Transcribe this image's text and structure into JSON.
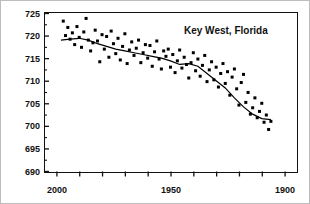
{
  "chart_data": {
    "type": "scatter",
    "title": "Key West, Florida",
    "xlabel": "",
    "ylabel": "Distance above Reference Level (cm)",
    "xlim": [
      2005,
      1895
    ],
    "ylim": [
      690,
      725
    ],
    "x_reversed": true,
    "grid": false,
    "legend": null,
    "y_ticks": [
      690,
      695,
      700,
      705,
      710,
      715,
      720,
      725
    ],
    "y_tick_labels": [
      "690",
      "695",
      "700",
      "705",
      "710",
      "715",
      "720",
      "725"
    ],
    "y_minor_step": 2.5,
    "x_ticks": [
      2000,
      1990,
      1980,
      1970,
      1960,
      1950,
      1940,
      1930,
      1920,
      1910,
      1900
    ],
    "x_tick_labels_shown": [
      "2000",
      "1950",
      "1900"
    ],
    "x_labeled_ticks": [
      2000,
      1950,
      1900
    ],
    "marker": "filled-square",
    "marker_size_px": 3,
    "series": [
      {
        "name": "Annual sea level measurements",
        "type": "scatter",
        "x": [
          1997,
          1996,
          1995,
          1994,
          1993,
          1992,
          1991,
          1990,
          1989,
          1988,
          1987,
          1986,
          1985,
          1984,
          1983,
          1982,
          1981,
          1980,
          1979,
          1978,
          1977,
          1976,
          1975,
          1974,
          1973,
          1972,
          1971,
          1970,
          1969,
          1968,
          1967,
          1966,
          1965,
          1964,
          1963,
          1962,
          1961,
          1960,
          1959,
          1958,
          1957,
          1956,
          1955,
          1954,
          1953,
          1952,
          1951,
          1950,
          1949,
          1948,
          1947,
          1946,
          1945,
          1944,
          1943,
          1942,
          1941,
          1940,
          1939,
          1938,
          1937,
          1936,
          1935,
          1934,
          1933,
          1932,
          1931,
          1930,
          1929,
          1928,
          1927,
          1926,
          1925,
          1924,
          1923,
          1922,
          1921,
          1920,
          1919,
          1918,
          1917,
          1916,
          1915,
          1914,
          1913,
          1912,
          1911,
          1910,
          1909,
          1908,
          1907,
          1906
        ],
        "y": [
          723.2,
          720.0,
          721.8,
          719.2,
          720.6,
          718.0,
          722.0,
          719.6,
          717.4,
          720.8,
          723.8,
          719.0,
          716.6,
          718.4,
          721.2,
          718.8,
          714.2,
          720.2,
          717.0,
          719.8,
          715.2,
          721.0,
          718.2,
          716.0,
          719.4,
          714.6,
          717.6,
          720.4,
          713.8,
          716.8,
          718.6,
          715.6,
          717.2,
          719.0,
          714.0,
          716.2,
          718.0,
          715.0,
          717.8,
          713.2,
          716.4,
          718.8,
          714.8,
          712.6,
          716.6,
          715.4,
          717.0,
          713.0,
          715.8,
          711.8,
          714.4,
          716.8,
          712.8,
          715.2,
          713.6,
          710.6,
          714.0,
          716.2,
          712.2,
          714.8,
          711.0,
          713.4,
          715.6,
          709.8,
          712.4,
          714.2,
          710.2,
          713.0,
          708.6,
          711.6,
          713.8,
          709.4,
          712.0,
          706.8,
          710.8,
          712.6,
          708.2,
          704.6,
          709.6,
          711.4,
          705.2,
          707.4,
          702.6,
          704.0,
          706.2,
          701.8,
          703.2,
          705.0,
          700.8,
          702.4,
          699.2,
          701.0
        ]
      },
      {
        "name": "Smoothed trend",
        "type": "line",
        "x": [
          1998,
          1994,
          1990,
          1986,
          1982,
          1978,
          1974,
          1970,
          1966,
          1962,
          1958,
          1954,
          1950,
          1946,
          1942,
          1938,
          1934,
          1930,
          1926,
          1922,
          1918,
          1914,
          1910,
          1906
        ],
        "y": [
          719.0,
          719.2,
          719.4,
          719.0,
          718.2,
          717.6,
          717.0,
          716.6,
          716.2,
          715.8,
          715.4,
          715.0,
          714.4,
          713.6,
          713.8,
          713.2,
          711.6,
          710.0,
          708.4,
          706.2,
          704.2,
          702.6,
          701.6,
          701.4
        ]
      }
    ]
  },
  "figure": {
    "title_position": "inside-top-right",
    "axis_color": "#111111",
    "marker_color": "#000000",
    "line_color": "#000000",
    "background": "#ffffff"
  }
}
